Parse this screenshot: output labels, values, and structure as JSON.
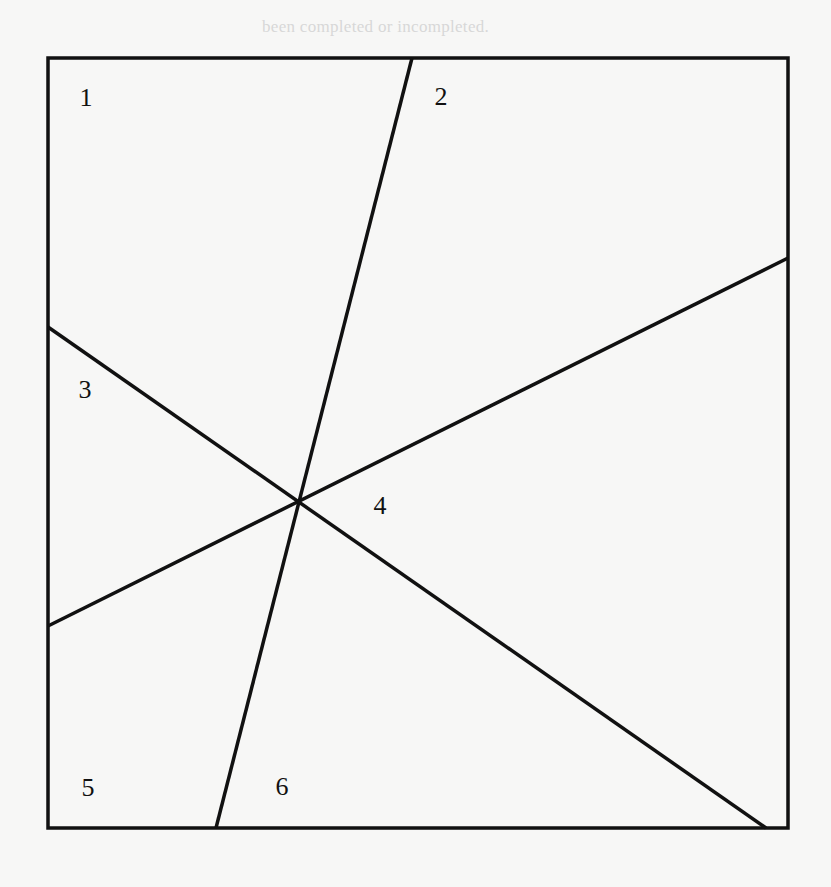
{
  "header": {
    "partial_text": "been completed or incompleted."
  },
  "diagram": {
    "box": {
      "x1": 48,
      "y1": 58,
      "x2": 788,
      "y2": 828
    },
    "stroke_color": "#111111",
    "stroke_width": 3.5,
    "lines": [
      {
        "name": "steep-line",
        "from": [
          412,
          58
        ],
        "to": [
          216,
          828
        ]
      },
      {
        "name": "rising-line",
        "from": [
          48,
          626
        ],
        "to": [
          788,
          258
        ]
      },
      {
        "name": "falling-line",
        "from": [
          48,
          327
        ],
        "to": [
          766,
          828
        ]
      }
    ],
    "intersection": [
      300,
      501
    ],
    "regions": [
      {
        "label": "1",
        "x": 86,
        "y": 98
      },
      {
        "label": "2",
        "x": 441,
        "y": 97
      },
      {
        "label": "3",
        "x": 85,
        "y": 390
      },
      {
        "label": "4",
        "x": 380,
        "y": 506
      },
      {
        "label": "5",
        "x": 88,
        "y": 788
      },
      {
        "label": "6",
        "x": 282,
        "y": 787
      }
    ]
  }
}
